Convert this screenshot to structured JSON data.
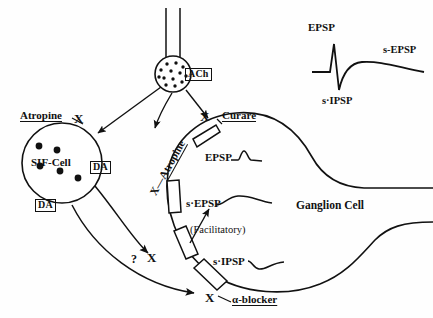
{
  "figure": {
    "background_color": "#fefefe",
    "ink_color": "#111111"
  },
  "presynaptic": {
    "transmitter_label": "ACh",
    "vesicle_count": 13,
    "axon_label": ""
  },
  "sif_cell": {
    "label": "SIF-Cell",
    "granule_count": 5,
    "blocker_label": "Atropine",
    "blocker_x": "X",
    "transmitter_label_upper": "DA",
    "transmitter_label_lower": "DA"
  },
  "ganglion_cell": {
    "label": "Ganglion Cell"
  },
  "receptors": [
    {
      "name": "nicotinic",
      "response_label": "EPSP",
      "blocker_label": "Curare",
      "blocker_x": "X"
    },
    {
      "name": "muscarinic",
      "response_label": "s·EPSP",
      "blocker_label": "Atropine",
      "blocker_x": "X"
    },
    {
      "name": "facilitatory",
      "response_label": "(Facilitatory)",
      "blocker_label": "?",
      "blocker_x": "X"
    },
    {
      "name": "inhibitory",
      "response_label": "s·IPSP",
      "blocker_label": "α-blocker",
      "blocker_x": "X"
    }
  ],
  "inset": {
    "epsp_label": "EPSP",
    "sipsp_label": "s·IPSP",
    "sepsp_label": "s-EPSP"
  }
}
